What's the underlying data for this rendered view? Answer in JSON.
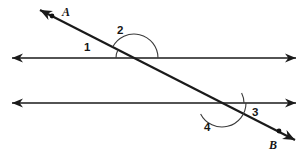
{
  "figure": {
    "kind": "geometry-diagram",
    "background_color": "#ffffff",
    "ink_color": "#1a1a1a",
    "arc_color": "#3a3a3a",
    "width": 306,
    "height": 159
  },
  "lines": {
    "upper_parallel": {
      "name": "upper-parallel-line",
      "x1": 12,
      "y1": 58,
      "x2": 296,
      "y2": 58,
      "arrow_start": true,
      "arrow_end": true
    },
    "lower_parallel": {
      "name": "lower-parallel-line",
      "x1": 12,
      "y1": 103,
      "x2": 296,
      "y2": 103,
      "arrow_start": true,
      "arrow_end": true
    },
    "transversal": {
      "name": "transversal-line-AB",
      "x1": 40,
      "y1": 10,
      "x2": 295,
      "y2": 140,
      "arrow_start": true,
      "arrow_end": true
    }
  },
  "intersections": {
    "upper": {
      "x": 134,
      "y": 58
    },
    "lower": {
      "x": 222,
      "y": 103
    }
  },
  "points": [
    {
      "id": "A",
      "label": "A",
      "dot_x": 52,
      "dot_y": 16,
      "label_x": 62,
      "label_y": 6
    },
    {
      "id": "B",
      "label": "B",
      "dot_x": 279,
      "dot_y": 131,
      "label_x": 269,
      "label_y": 139
    }
  ],
  "angles": [
    {
      "id": "1",
      "label": "1",
      "name": "angle-1",
      "position": "upper-left-interior",
      "vertex": {
        "x": 134,
        "y": 58
      },
      "radius": 18,
      "start_deg": 180,
      "end_deg": 207,
      "label_x": 84,
      "label_y": 42
    },
    {
      "id": "2",
      "label": "2",
      "name": "angle-2",
      "position": "upper-above-right",
      "vertex": {
        "x": 134,
        "y": 58
      },
      "radius": 24,
      "start_deg": 207,
      "end_deg": 360,
      "label_x": 117,
      "label_y": 25
    },
    {
      "id": "3",
      "label": "3",
      "name": "angle-3",
      "position": "lower-right-interior",
      "vertex": {
        "x": 222,
        "y": 103
      },
      "radius": 22,
      "start_deg": 333,
      "end_deg": 360,
      "label_x": 252,
      "label_y": 107
    },
    {
      "id": "4",
      "label": "4",
      "name": "angle-4",
      "position": "lower-below-left",
      "vertex": {
        "x": 222,
        "y": 103
      },
      "radius": 24,
      "start_deg": 0,
      "end_deg": 153,
      "label_x": 204,
      "label_y": 122
    }
  ],
  "labels": {
    "angle_1": "1",
    "angle_2": "2",
    "angle_3": "3",
    "angle_4": "4",
    "point_a": "A",
    "point_b": "B"
  }
}
